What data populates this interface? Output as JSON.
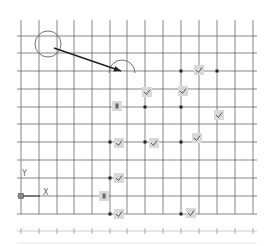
{
  "canvas": {
    "width": 267,
    "height": 246,
    "background": "#ffffff",
    "grid_color": "#555555",
    "marker_fill": "#d9d9d9"
  },
  "grid": {
    "vertical_x": [
      21,
      39,
      57,
      74,
      92,
      110,
      127,
      145,
      163,
      181,
      199,
      217,
      235,
      253
    ],
    "horizontal_y": [
      36,
      53,
      71,
      89,
      107,
      124,
      142,
      160,
      178,
      196,
      214
    ],
    "x_start": 17,
    "x_end": 257,
    "y_start": 20,
    "y_end": 231,
    "tick_row_y": 231
  },
  "shapes": {
    "circle": {
      "cx": 48,
      "cy": 44,
      "r": 13
    },
    "arc": {
      "cx": 122,
      "cy": 73,
      "r": 13
    },
    "arrow": {
      "x1": 54,
      "y1": 48,
      "x2": 121,
      "y2": 71
    }
  },
  "ucs": {
    "origin": {
      "x": 21,
      "y": 196
    },
    "x_label": "X",
    "y_label": "Y"
  },
  "markers": [
    {
      "type": "check",
      "x": 199,
      "y": 70
    },
    {
      "type": "check",
      "x": 147,
      "y": 92
    },
    {
      "type": "check",
      "x": 183,
      "y": 91
    },
    {
      "type": "square",
      "x": 117,
      "y": 106
    },
    {
      "type": "check",
      "x": 219,
      "y": 115
    },
    {
      "type": "check",
      "x": 119,
      "y": 143
    },
    {
      "type": "check",
      "x": 154,
      "y": 143
    },
    {
      "type": "check",
      "x": 197,
      "y": 138
    },
    {
      "type": "check",
      "x": 119,
      "y": 178
    },
    {
      "type": "square",
      "x": 104,
      "y": 196
    },
    {
      "type": "check",
      "x": 119,
      "y": 214
    },
    {
      "type": "check",
      "x": 191,
      "y": 213
    }
  ],
  "dots": [
    {
      "x": 181,
      "y": 71
    },
    {
      "x": 217,
      "y": 71
    },
    {
      "x": 145,
      "y": 107
    },
    {
      "x": 181,
      "y": 107
    },
    {
      "x": 110,
      "y": 142
    },
    {
      "x": 145,
      "y": 142
    },
    {
      "x": 181,
      "y": 142
    },
    {
      "x": 110,
      "y": 178
    },
    {
      "x": 110,
      "y": 214
    },
    {
      "x": 181,
      "y": 214
    }
  ]
}
